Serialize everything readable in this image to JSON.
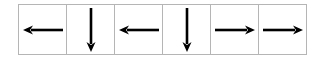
{
  "diagram": {
    "title": "",
    "border_color": "#b5b5b5",
    "arrow_color": "#000000",
    "cells": [
      {
        "direction": "left",
        "icon": "arrow-left-icon"
      },
      {
        "direction": "down",
        "icon": "arrow-down-icon"
      },
      {
        "direction": "left",
        "icon": "arrow-left-icon"
      },
      {
        "direction": "down",
        "icon": "arrow-down-icon"
      },
      {
        "direction": "right",
        "icon": "arrow-right-icon"
      },
      {
        "direction": "right",
        "icon": "arrow-right-icon"
      }
    ]
  }
}
